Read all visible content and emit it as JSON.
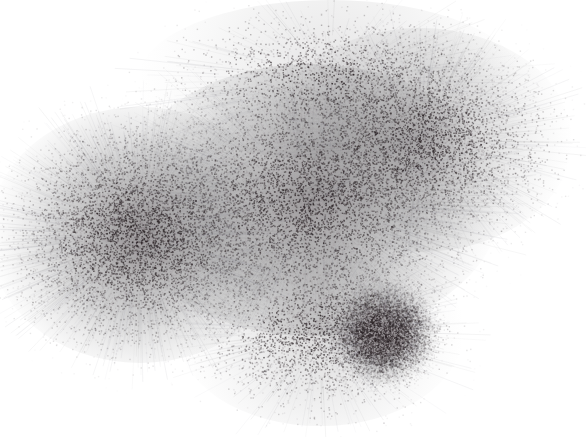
{
  "figure": {
    "type": "network-graph-layout",
    "width": 586,
    "height": 437,
    "background": "#ffffff",
    "node_color_dark": "#2e2628",
    "node_color_light": "#9a9a9a",
    "clusters": [
      {
        "name": "left-cluster",
        "cx": 140,
        "cy": 235,
        "rx": 95,
        "ry": 80,
        "density": 1.0
      },
      {
        "name": "center-cluster",
        "cx": 310,
        "cy": 200,
        "rx": 120,
        "ry": 85,
        "density": 0.95
      },
      {
        "name": "upper-right-cluster",
        "cx": 420,
        "cy": 140,
        "rx": 95,
        "ry": 70,
        "density": 0.6
      },
      {
        "name": "small-lower-cluster",
        "cx": 383,
        "cy": 333,
        "rx": 35,
        "ry": 32,
        "density": 0.9
      },
      {
        "name": "lower-halo",
        "cx": 320,
        "cy": 330,
        "rx": 90,
        "ry": 60,
        "density": 0.35
      },
      {
        "name": "top-fringe",
        "cx": 330,
        "cy": 80,
        "rx": 120,
        "ry": 50,
        "density": 0.25
      }
    ]
  }
}
